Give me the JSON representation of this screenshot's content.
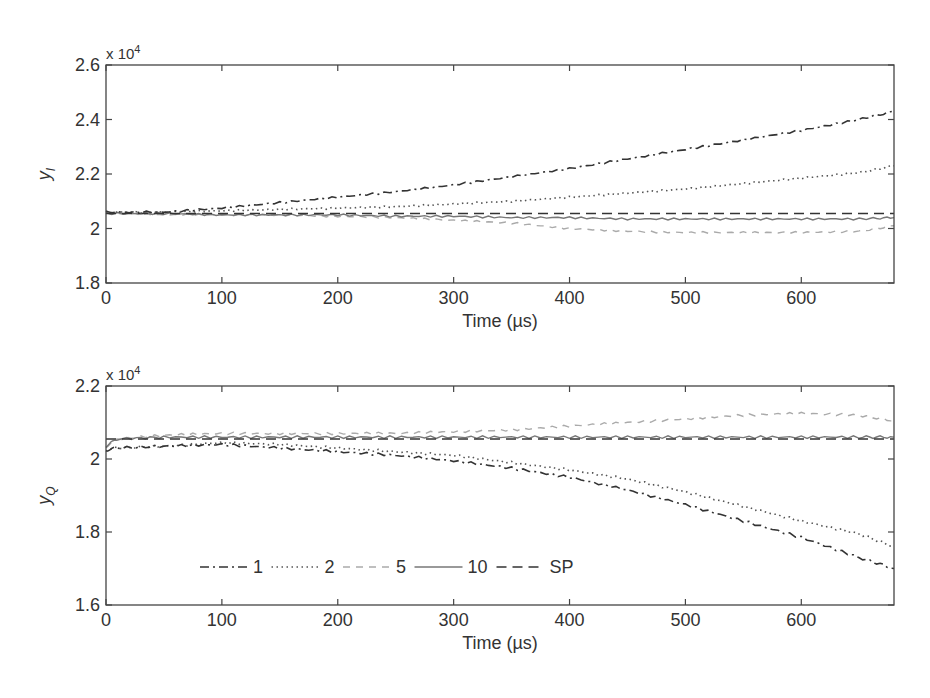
{
  "chart_data": [
    {
      "type": "line",
      "panel": "top",
      "title": "",
      "ylabel": "y_I",
      "ylabel_main": "y",
      "ylabel_sub": "I",
      "xlabel": "Time (µs)",
      "y_multiplier": "x 10",
      "y_multiplier_exp": "4",
      "xlim": [
        0,
        680
      ],
      "ylim": [
        1.8,
        2.6
      ],
      "xticks": [
        "0",
        "100",
        "200",
        "300",
        "400",
        "500",
        "600"
      ],
      "yticks": [
        "1.8",
        "2",
        "2.2",
        "2.4",
        "2.6"
      ],
      "grid": false,
      "x": [
        0,
        50,
        100,
        150,
        200,
        250,
        300,
        350,
        400,
        450,
        500,
        550,
        600,
        650,
        680
      ],
      "series": [
        {
          "name": "1",
          "style": "dashdot",
          "color": "#333333",
          "values": [
            2.06,
            2.06,
            2.075,
            2.095,
            2.115,
            2.135,
            2.16,
            2.19,
            2.22,
            2.255,
            2.29,
            2.325,
            2.36,
            2.4,
            2.43
          ]
        },
        {
          "name": "2",
          "style": "dotted",
          "color": "#555555",
          "values": [
            2.06,
            2.06,
            2.065,
            2.07,
            2.075,
            2.08,
            2.09,
            2.1,
            2.115,
            2.13,
            2.145,
            2.165,
            2.185,
            2.205,
            2.23
          ]
        },
        {
          "name": "5",
          "style": "dashed-light",
          "color": "#aaaaaa",
          "values": [
            2.055,
            2.05,
            2.05,
            2.05,
            2.045,
            2.04,
            2.03,
            2.02,
            2.0,
            1.99,
            1.985,
            1.985,
            1.985,
            1.99,
            2.01
          ]
        },
        {
          "name": "10",
          "style": "solid",
          "color": "#777777",
          "values": [
            2.055,
            2.055,
            2.05,
            2.05,
            2.05,
            2.045,
            2.045,
            2.04,
            2.04,
            2.035,
            2.035,
            2.035,
            2.035,
            2.035,
            2.04
          ]
        },
        {
          "name": "SP",
          "style": "dashed",
          "color": "#333333",
          "values": [
            2.055,
            2.055,
            2.055,
            2.055,
            2.055,
            2.055,
            2.055,
            2.055,
            2.055,
            2.055,
            2.055,
            2.055,
            2.055,
            2.055,
            2.055
          ]
        }
      ]
    },
    {
      "type": "line",
      "panel": "bottom",
      "title": "",
      "ylabel": "y_Q",
      "ylabel_main": "y",
      "ylabel_sub": "Q",
      "xlabel": "Time (µs)",
      "y_multiplier": "x 10",
      "y_multiplier_exp": "4",
      "xlim": [
        0,
        680
      ],
      "ylim": [
        1.6,
        2.2
      ],
      "xticks": [
        "0",
        "100",
        "200",
        "300",
        "400",
        "500",
        "600"
      ],
      "yticks": [
        "1.6",
        "1.8",
        "2",
        "2.2"
      ],
      "grid": false,
      "legend": {
        "position": "lower-left inside",
        "entries": [
          "1",
          "2",
          "5",
          "10",
          "SP"
        ]
      },
      "x": [
        0,
        10,
        50,
        100,
        150,
        200,
        250,
        300,
        350,
        400,
        450,
        500,
        550,
        600,
        650,
        680
      ],
      "series": [
        {
          "name": "1",
          "style": "dashdot",
          "color": "#333333",
          "values": [
            2.025,
            2.03,
            2.035,
            2.04,
            2.03,
            2.02,
            2.01,
            1.995,
            1.975,
            1.95,
            1.915,
            1.875,
            1.83,
            1.785,
            1.73,
            1.7
          ]
        },
        {
          "name": "2",
          "style": "dotted",
          "color": "#555555",
          "values": [
            2.025,
            2.03,
            2.035,
            2.045,
            2.04,
            2.03,
            2.02,
            2.01,
            1.99,
            1.97,
            1.945,
            1.91,
            1.87,
            1.83,
            1.795,
            1.76
          ]
        },
        {
          "name": "5",
          "style": "dashed-light",
          "color": "#aaaaaa",
          "values": [
            2.035,
            2.055,
            2.065,
            2.07,
            2.07,
            2.07,
            2.07,
            2.075,
            2.08,
            2.09,
            2.1,
            2.11,
            2.12,
            2.125,
            2.12,
            2.105
          ]
        },
        {
          "name": "10",
          "style": "solid",
          "color": "#777777",
          "values": [
            2.035,
            2.055,
            2.06,
            2.06,
            2.06,
            2.06,
            2.06,
            2.06,
            2.06,
            2.06,
            2.06,
            2.06,
            2.06,
            2.06,
            2.06,
            2.06
          ]
        },
        {
          "name": "SP",
          "style": "dashed",
          "color": "#333333",
          "values": [
            2.055,
            2.055,
            2.055,
            2.055,
            2.055,
            2.055,
            2.055,
            2.055,
            2.055,
            2.055,
            2.055,
            2.055,
            2.055,
            2.055,
            2.055,
            2.055
          ]
        }
      ]
    }
  ]
}
